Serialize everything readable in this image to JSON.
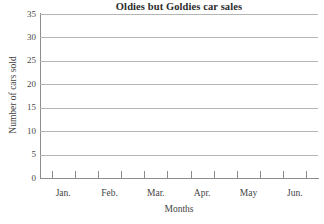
{
  "chart_data": {
    "type": "bar",
    "title": "Oldies but Goldies car sales",
    "xlabel": "Months",
    "ylabel": "Number of cars sold",
    "categories": [
      "Jan.",
      "Feb.",
      "Mar.",
      "Apr.",
      "May",
      "Jun."
    ],
    "values": [
      null,
      null,
      null,
      null,
      null,
      null
    ],
    "series": [],
    "ylim": [
      0,
      35
    ],
    "y_ticks": [
      0,
      5,
      10,
      15,
      20,
      25,
      30,
      35
    ],
    "y_tick_labels": [
      "0",
      "5",
      "10",
      "15",
      "20",
      "25",
      "30",
      "35"
    ],
    "grid": true,
    "legend": false,
    "legend_position": "none",
    "note": "empty plotting grid, no data plotted",
    "colors": {
      "background": "#ffffff",
      "gridline": "#b4b4b4",
      "axis": "#8c8c8c",
      "title_text": "#2b2b2b",
      "label_text": "#454545"
    }
  }
}
